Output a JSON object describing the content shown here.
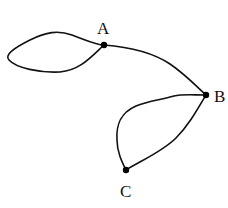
{
  "diagram": {
    "type": "graph",
    "nodes": [
      {
        "id": "A",
        "label": "A",
        "x": 104,
        "y": 45,
        "label_x": 97,
        "label_y": 34
      },
      {
        "id": "B",
        "label": "B",
        "x": 206,
        "y": 95,
        "label_x": 214,
        "label_y": 102
      },
      {
        "id": "C",
        "label": "C",
        "x": 126,
        "y": 170,
        "label_x": 120,
        "label_y": 197
      }
    ],
    "edges": [
      {
        "from": "A",
        "to": "A",
        "kind": "loop"
      },
      {
        "from": "A",
        "to": "B",
        "kind": "curve"
      },
      {
        "from": "B",
        "to": "C",
        "kind": "curve-upper"
      },
      {
        "from": "B",
        "to": "C",
        "kind": "curve-lower"
      }
    ],
    "colors": {
      "stroke": "#111111",
      "node": "#000000",
      "background": "#ffffff"
    }
  }
}
